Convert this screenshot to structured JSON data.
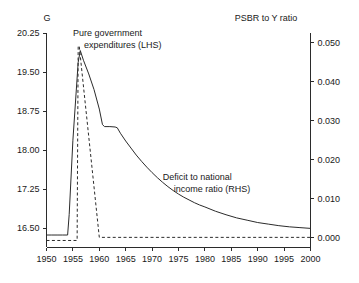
{
  "chart_data": {
    "type": "line",
    "title": "",
    "xlabel": "",
    "ylabel": "G",
    "y2label": "PSBR to Y ratio",
    "grid": false,
    "legend_position": "inline-annotations",
    "xlim": [
      1950,
      2000
    ],
    "ylim": [
      16.125,
      20.25
    ],
    "y2lim": [
      -0.0025,
      0.0525
    ],
    "xticks": [
      1950,
      1955,
      1960,
      1965,
      1970,
      1975,
      1980,
      1985,
      1990,
      1995,
      2000
    ],
    "xticklabels": [
      "1950",
      "1955",
      "1960",
      "1965",
      "1970",
      "1975",
      "1980",
      "1985",
      "1990",
      "1995",
      "2000"
    ],
    "yticks": [
      16.5,
      17.25,
      18.0,
      18.75,
      19.5,
      20.25
    ],
    "yticklabels": [
      "16.50",
      "17.25",
      "18.00",
      "18.75",
      "19.50",
      "20.25"
    ],
    "y2ticks": [
      0.0,
      0.01,
      0.02,
      0.03,
      0.04,
      0.05
    ],
    "y2ticklabels": [
      "0.000",
      "0.010",
      "0.020",
      "0.030",
      "0.040",
      "0.050"
    ],
    "series": [
      {
        "name": "Pure government expenditures (LHS)",
        "axis": "left",
        "style": "dashed",
        "x": [
          1950.0,
          1955.8,
          1956.0,
          1956.2,
          1960.0,
          1960.2,
          2000.0
        ],
        "values": [
          16.26,
          16.26,
          20.0,
          20.0,
          16.32,
          16.32,
          16.32
        ]
      },
      {
        "name": "Deficit to national income ratio (RHS)",
        "axis": "right",
        "style": "solid",
        "x": [
          1950,
          1951,
          1952,
          1953,
          1954,
          1954.3,
          1955,
          1956,
          1956.4,
          1957,
          1958,
          1959,
          1960,
          1960.6,
          1961,
          1962,
          1963,
          1963.4,
          1964,
          1965,
          1966,
          1967,
          1968,
          1969,
          1970,
          1971,
          1972,
          1973,
          1974,
          1975,
          1976,
          1977,
          1978,
          1979,
          1980,
          1982,
          1984,
          1986,
          1988,
          1990,
          1992,
          1994,
          1996,
          1998,
          2000
        ],
        "values": [
          0.0007,
          0.0007,
          0.0007,
          0.0007,
          0.0007,
          0.006,
          0.025,
          0.045,
          0.048,
          0.0455,
          0.042,
          0.038,
          0.033,
          0.029,
          0.0285,
          0.0285,
          0.0284,
          0.0282,
          0.0268,
          0.0248,
          0.023,
          0.0212,
          0.0196,
          0.0181,
          0.0167,
          0.0154,
          0.0142,
          0.0131,
          0.0121,
          0.0112,
          0.0104,
          0.0097,
          0.009,
          0.0084,
          0.0079,
          0.0068,
          0.0059,
          0.0051,
          0.0045,
          0.0039,
          0.0035,
          0.0031,
          0.0028,
          0.0026,
          0.0024
        ]
      }
    ],
    "annotations": [
      {
        "name": "pure-government-expenditures",
        "lines": [
          "Pure government",
          "expenditures (LHS)"
        ],
        "anchor_x": 1955.0,
        "anchor_y_px": 36
      },
      {
        "name": "deficit-to-national-income-ratio",
        "lines": [
          "Deficit to national",
          "income ratio (RHS)"
        ],
        "anchor_x": 1972.0,
        "anchor_y_px": 180
      }
    ]
  },
  "axes": {
    "left_title": "G",
    "right_title": "PSBR to Y ratio"
  },
  "colors": {
    "line": "#2b2b2b",
    "axis": "#2b2b2b",
    "background": "#ffffff",
    "text": "#1a1a1a"
  }
}
